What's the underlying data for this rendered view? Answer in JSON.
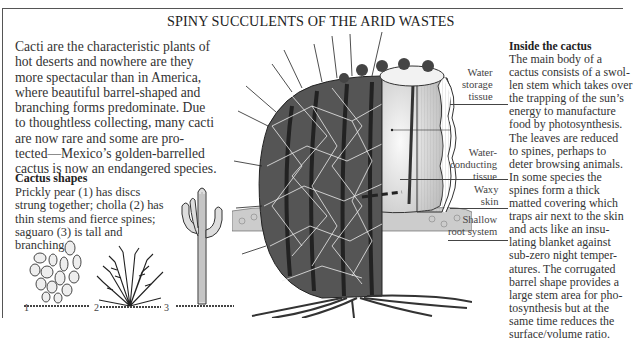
{
  "title": "SPINY SUCCULENTS OF THE ARID WASTES",
  "intro": {
    "lines": [
      "Cacti are the characteristic plants of",
      "hot deserts and nowhere are they",
      "more spectacular than in America,",
      "where beautiful barrel-shaped and",
      "branching forms predominate. Due",
      "to thoughtless collecting, many cacti",
      "are now rare and some are pro-",
      "tected—Mexico’s golden-barrelled",
      "cactus is now an endangered species."
    ]
  },
  "cactus_shapes": {
    "heading": "Cactus shapes",
    "lines": [
      "Prickly pear (1) has discs",
      "strung together; cholla (2) has",
      "thin stems and fierce spines;",
      "saguaro (3) is tall and",
      "branching."
    ],
    "figures": [
      {
        "number": "1",
        "name": "prickly-pear"
      },
      {
        "number": "2",
        "name": "cholla"
      },
      {
        "number": "3",
        "name": "saguaro"
      }
    ]
  },
  "inside": {
    "heading": "Inside the cactus",
    "lines": [
      "The main body of a",
      "cactus consists of a swol-",
      "len stem which takes over",
      "the trapping of the sun’s",
      "energy to manufacture",
      "food by photosynthesis.",
      "The leaves are reduced",
      "to spines, perhaps to",
      "deter browsing animals.",
      "In some species the",
      "spines form a thick",
      "matted covering which",
      "traps air next to the skin",
      "and acts like an insu-",
      "lating blanket against",
      "sub-zero night temper-",
      "atures. The corrugated",
      "barrel shape provides a",
      "large stem area for pho-",
      "tosynthesis but at the",
      "same time reduces the",
      "surface/volume ratio."
    ]
  },
  "diagram_labels": {
    "water_storage": [
      "Water",
      "storage",
      "tissue"
    ],
    "water_conducting": [
      "Water-",
      "conducting",
      "tissue"
    ],
    "waxy_skin": [
      "Waxy",
      "skin"
    ],
    "root_system": [
      "Shallow",
      "root system"
    ]
  }
}
